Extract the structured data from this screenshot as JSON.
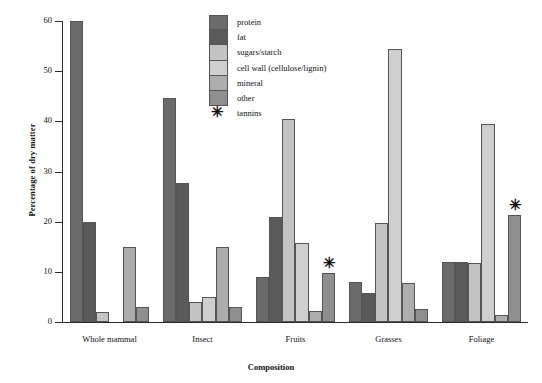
{
  "chart_data": {
    "type": "bar",
    "title": "",
    "xlabel": "Composition",
    "ylabel": "Percentage of dry matter",
    "ylim": [
      0,
      60
    ],
    "yticks": [
      0,
      10,
      20,
      30,
      40,
      50,
      60
    ],
    "grid": false,
    "legend_position": "top-center",
    "categories": [
      "Whole mammal",
      "Insect",
      "Fruits",
      "Grasses",
      "Foliage"
    ],
    "series": [
      {
        "name": "protein",
        "color": "#6b6b6b",
        "values": [
          60.0,
          44.7,
          9.0,
          8.0,
          11.9
        ]
      },
      {
        "name": "fat",
        "color": "#5a5a5a",
        "values": [
          20.0,
          27.8,
          20.9,
          5.7,
          11.9
        ]
      },
      {
        "name": "sugars/starch",
        "color": "#c3c3c3",
        "values": [
          2.0,
          4.0,
          40.5,
          19.8,
          11.7
        ]
      },
      {
        "name": "cell wall (cellulose/lignin)",
        "color": "#cfcfcf",
        "values": [
          0,
          4.9,
          15.8,
          54.5,
          39.5
        ]
      },
      {
        "name": "mineral",
        "color": "#adadad",
        "values": [
          15.0,
          15.0,
          2.2,
          7.7,
          1.3
        ]
      },
      {
        "name": "other",
        "color": "#8f8f8f",
        "values": [
          2.9,
          2.9,
          9.8,
          2.5,
          21.3
        ]
      }
    ],
    "annotations": [
      {
        "label": "tannins-marker",
        "symbol": "✳",
        "category": "Fruits",
        "series": "other"
      },
      {
        "label": "tannins-marker",
        "symbol": "✳",
        "category": "Foliage",
        "series": "other"
      }
    ],
    "legend_extra": {
      "symbol": "✳",
      "label": "tannins"
    }
  }
}
